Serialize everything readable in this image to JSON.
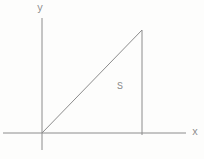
{
  "figure": {
    "labels": {
      "y_axis": "y",
      "x_axis": "x",
      "region": "S"
    },
    "colors": {
      "line": "#8c8c8c",
      "text": "#8a8a8a",
      "background": "#fdfdfc"
    }
  }
}
